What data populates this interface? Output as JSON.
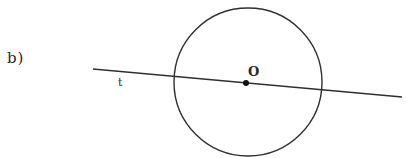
{
  "figure": {
    "part_label": "b)",
    "line_label": "t",
    "center_label": "O",
    "stroke_color": "#2f2f2f",
    "background": "#ffffff"
  },
  "geometry": {
    "circle": {
      "cx": 248,
      "cy": 82,
      "r": 74
    },
    "line": {
      "x1": 93,
      "y1": 69,
      "x2": 402,
      "y2": 97
    },
    "center_point": {
      "cx": 246,
      "cy": 83,
      "r": 3
    }
  }
}
